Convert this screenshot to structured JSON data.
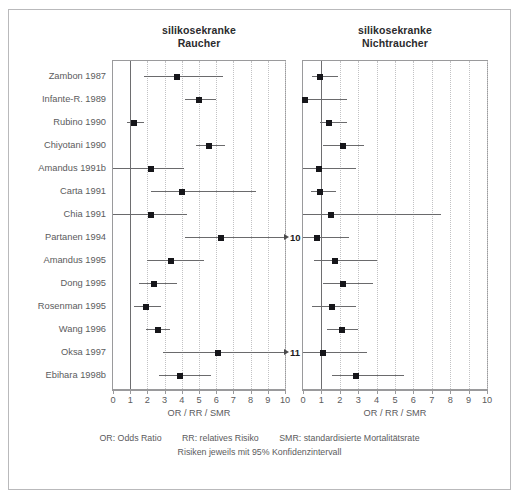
{
  "figure": {
    "panels": [
      {
        "id": "left",
        "title_line1": "silikosekranke",
        "title_line2": "Raucher",
        "axis_label": "OR / RR / SMR",
        "xlim": [
          0,
          10
        ],
        "ticks": [
          0,
          1,
          2,
          3,
          4,
          5,
          6,
          7,
          8,
          9,
          10
        ],
        "tick_labels": [
          "0",
          "1",
          "2",
          "3",
          "4",
          "5",
          "6",
          "7",
          "8",
          "9",
          "10"
        ],
        "reference_value": 1
      },
      {
        "id": "right",
        "title_line1": "silikosekranke",
        "title_line2": "Nichtraucher",
        "axis_label": "OR / RR / SMR",
        "xlim": [
          0,
          10
        ],
        "ticks": [
          0,
          1,
          2,
          3,
          4,
          5,
          6,
          7,
          8,
          9,
          10
        ],
        "tick_labels": [
          "0",
          "1",
          "2",
          "3",
          "4",
          "5",
          "6",
          "7",
          "8",
          "9",
          "10"
        ],
        "reference_value": 1
      }
    ],
    "studies": [
      "Zambon 1987",
      "Infante-R. 1989",
      "Rubino 1990",
      "Chiyotani 1990",
      "Amandus 1991b",
      "Carta 1991",
      "Chia 1991",
      "Partanen 1994",
      "Amandus 1995",
      "Dong 1995",
      "Rosenman 1995",
      "Wang 1996",
      "Oksa 1997",
      "Ebihara 1998b"
    ],
    "footer": {
      "abbr_or": "OR: Odds Ratio",
      "abbr_rr": "RR: relatives Risiko",
      "abbr_smr": "SMR: standardisierte Mortalitätsrate",
      "note": "Risiken jeweils mit 95% Konfidenzintervall"
    },
    "colors": {
      "marker": "#16161a",
      "ci_line": "#6a6a6c",
      "reference_line": "#6e6e70",
      "gridline": "#c2c2c4",
      "frame": "#9a9a9c",
      "outer_border": "#b9b9bb",
      "text": "#5b5b5d",
      "title_text": "#2b2b2d"
    }
  },
  "chart_data": {
    "type": "scatter",
    "chart_kind": "forest-plot",
    "xlabel": "OR / RR / SMR",
    "ylabel": "",
    "xlim": [
      0,
      10
    ],
    "grid": true,
    "legend": "none",
    "reference_line": 1,
    "categories": [
      "Zambon 1987",
      "Infante-R. 1989",
      "Rubino 1990",
      "Chiyotani 1990",
      "Amandus 1991b",
      "Carta 1991",
      "Chia 1991",
      "Partanen 1994",
      "Amandus 1995",
      "Dong 1995",
      "Rosenman 1995",
      "Wang 1996",
      "Oksa 1997",
      "Ebihara 1998b"
    ],
    "series": [
      {
        "name": "silikosekranke Raucher",
        "panel": "left",
        "points": [
          {
            "study": "Zambon 1987",
            "estimate": 3.7,
            "ci_low": 1.8,
            "ci_high": 6.4,
            "ci_high_clipped": false
          },
          {
            "study": "Infante-R. 1989",
            "estimate": 5.0,
            "ci_low": 4.2,
            "ci_high": 6.0,
            "ci_high_clipped": false
          },
          {
            "study": "Rubino 1990",
            "estimate": 1.2,
            "ci_low": 0.8,
            "ci_high": 1.8,
            "ci_high_clipped": false
          },
          {
            "study": "Chiyotani 1990",
            "estimate": 5.6,
            "ci_low": 4.8,
            "ci_high": 6.5,
            "ci_high_clipped": false
          },
          {
            "study": "Amandus 1991b",
            "estimate": 2.2,
            "ci_low": 0.0,
            "ci_high": 4.1,
            "ci_high_clipped": false
          },
          {
            "study": "Carta 1991",
            "estimate": 4.0,
            "ci_low": 2.2,
            "ci_high": 8.3,
            "ci_high_clipped": false
          },
          {
            "study": "Chia 1991",
            "estimate": 2.2,
            "ci_low": 0.0,
            "ci_high": 4.3,
            "ci_high_clipped": false
          },
          {
            "study": "Partanen 1994",
            "estimate": 6.3,
            "ci_low": 4.2,
            "ci_high": 10.0,
            "ci_high_clipped": true,
            "clip_label": "10"
          },
          {
            "study": "Amandus 1995",
            "estimate": 3.4,
            "ci_low": 2.0,
            "ci_high": 5.3,
            "ci_high_clipped": false
          },
          {
            "study": "Dong 1995",
            "estimate": 2.4,
            "ci_low": 1.5,
            "ci_high": 3.7,
            "ci_high_clipped": false
          },
          {
            "study": "Rosenman 1995",
            "estimate": 1.9,
            "ci_low": 1.2,
            "ci_high": 2.8,
            "ci_high_clipped": false
          },
          {
            "study": "Wang 1996",
            "estimate": 2.6,
            "ci_low": 1.9,
            "ci_high": 3.3,
            "ci_high_clipped": false
          },
          {
            "study": "Oksa 1997",
            "estimate": 6.1,
            "ci_low": 2.9,
            "ci_high": 10.0,
            "ci_high_clipped": true,
            "clip_label": "11"
          },
          {
            "study": "Ebihara 1998b",
            "estimate": 3.9,
            "ci_low": 2.7,
            "ci_high": 5.7,
            "ci_high_clipped": false
          }
        ]
      },
      {
        "name": "silikosekranke Nichtraucher",
        "panel": "right",
        "points": [
          {
            "study": "Zambon 1987",
            "estimate": 0.95,
            "ci_low": 0.5,
            "ci_high": 1.9,
            "ci_high_clipped": false
          },
          {
            "study": "Infante-R. 1989",
            "estimate": 0.1,
            "ci_low": 0.0,
            "ci_high": 2.4,
            "ci_high_clipped": false
          },
          {
            "study": "Rubino 1990",
            "estimate": 1.4,
            "ci_low": 0.95,
            "ci_high": 2.4,
            "ci_high_clipped": false
          },
          {
            "study": "Chiyotani 1990",
            "estimate": 2.15,
            "ci_low": 1.1,
            "ci_high": 3.3,
            "ci_high_clipped": false
          },
          {
            "study": "Amandus 1991b",
            "estimate": 0.85,
            "ci_low": 0.0,
            "ci_high": 2.9,
            "ci_high_clipped": false
          },
          {
            "study": "Carta 1991",
            "estimate": 0.95,
            "ci_low": 0.45,
            "ci_high": 1.8,
            "ci_high_clipped": false
          },
          {
            "study": "Chia 1991",
            "estimate": 1.5,
            "ci_low": 0.0,
            "ci_high": 7.5,
            "ci_high_clipped": false
          },
          {
            "study": "Partanen 1994",
            "estimate": 0.75,
            "ci_low": 0.0,
            "ci_high": 2.5,
            "ci_high_clipped": false
          },
          {
            "study": "Amandus 1995",
            "estimate": 1.75,
            "ci_low": 0.6,
            "ci_high": 4.0,
            "ci_high_clipped": false
          },
          {
            "study": "Dong 1995",
            "estimate": 2.2,
            "ci_low": 1.1,
            "ci_high": 3.8,
            "ci_high_clipped": false
          },
          {
            "study": "Rosenman 1995",
            "estimate": 1.6,
            "ci_low": 0.5,
            "ci_high": 2.9,
            "ci_high_clipped": false
          },
          {
            "study": "Wang 1996",
            "estimate": 2.1,
            "ci_low": 1.3,
            "ci_high": 3.0,
            "ci_high_clipped": false
          },
          {
            "study": "Oksa 1997",
            "estimate": 1.1,
            "ci_low": 0.0,
            "ci_high": 3.5,
            "ci_high_clipped": false
          },
          {
            "study": "Ebihara 1998b",
            "estimate": 2.9,
            "ci_low": 1.6,
            "ci_high": 5.5,
            "ci_high_clipped": false
          }
        ]
      }
    ]
  }
}
